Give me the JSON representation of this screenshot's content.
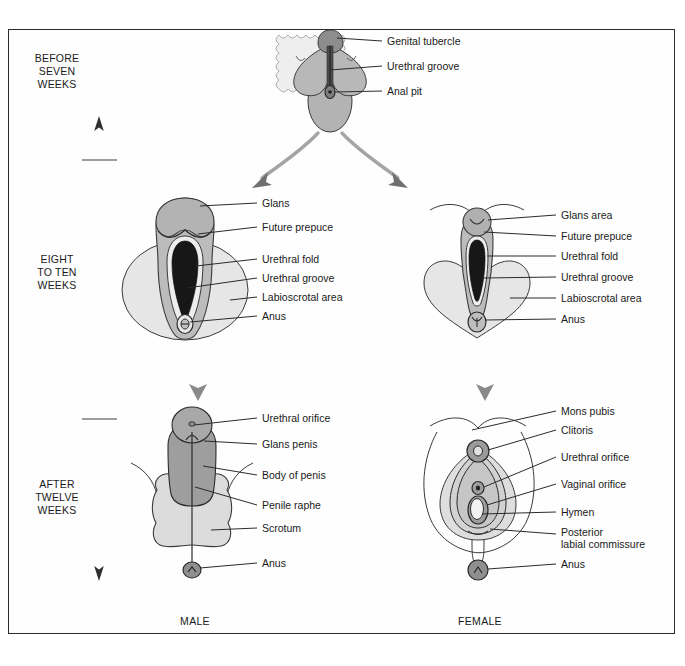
{
  "figure": {
    "type": "embryology-diagram",
    "background_color": "#ffffff",
    "border_color": "#2b2b2b",
    "fill_light": "#e3e3e3",
    "fill_mid": "#c9c9c9",
    "fill_dark": "#a9a9a9",
    "fill_darkest": "#8f8f8f",
    "line_color": "#2b2b2b",
    "arrow_color": "#8a8a8a"
  },
  "timeline": {
    "axis_name": "developmental-time-axis",
    "stages": [
      {
        "id": "before-seven-weeks",
        "label": "BEFORE\nSEVEN\nWEEKS"
      },
      {
        "id": "eight-to-ten-weeks",
        "label": "EIGHT\nTO TEN\nWEEKS"
      },
      {
        "id": "after-twelve-weeks",
        "label": "AFTER\nTWELVE\nWEEKS"
      }
    ]
  },
  "columns": [
    {
      "id": "male",
      "label": "MALE"
    },
    {
      "id": "female",
      "label": "FEMALE"
    }
  ],
  "panels": {
    "indifferent": {
      "id": "indifferent-stage-panel",
      "stage": "before-seven-weeks",
      "labels": [
        {
          "id": "genital-tubercle",
          "text": "Genital tubercle"
        },
        {
          "id": "urethral-groove",
          "text": "Urethral groove"
        },
        {
          "id": "anal-pit",
          "text": "Anal pit"
        }
      ]
    },
    "male_mid": {
      "id": "male-eight-to-ten-weeks-panel",
      "stage": "eight-to-ten-weeks",
      "sex": "male",
      "labels": [
        {
          "id": "glans",
          "text": "Glans"
        },
        {
          "id": "future-prepuce",
          "text": "Future prepuce"
        },
        {
          "id": "urethral-fold",
          "text": "Urethral fold"
        },
        {
          "id": "urethral-groove",
          "text": "Urethral groove"
        },
        {
          "id": "labioscrotal-area",
          "text": "Labioscrotal area"
        },
        {
          "id": "anus",
          "text": "Anus"
        }
      ]
    },
    "female_mid": {
      "id": "female-eight-to-ten-weeks-panel",
      "stage": "eight-to-ten-weeks",
      "sex": "female",
      "labels": [
        {
          "id": "glans-area",
          "text": "Glans area"
        },
        {
          "id": "future-prepuce",
          "text": "Future prepuce"
        },
        {
          "id": "urethral-fold",
          "text": "Urethral fold"
        },
        {
          "id": "urethral-groove",
          "text": "Urethral groove"
        },
        {
          "id": "labioscrotal-area",
          "text": "Labioscrotal area"
        },
        {
          "id": "anus",
          "text": "Anus"
        }
      ]
    },
    "male_late": {
      "id": "male-after-twelve-weeks-panel",
      "stage": "after-twelve-weeks",
      "sex": "male",
      "labels": [
        {
          "id": "urethral-orifice",
          "text": "Urethral orifice"
        },
        {
          "id": "glans-penis",
          "text": "Glans penis"
        },
        {
          "id": "body-of-penis",
          "text": "Body of penis"
        },
        {
          "id": "penile-raphe",
          "text": "Penile raphe"
        },
        {
          "id": "scrotum",
          "text": "Scrotum"
        },
        {
          "id": "anus",
          "text": "Anus"
        }
      ]
    },
    "female_late": {
      "id": "female-after-twelve-weeks-panel",
      "stage": "after-twelve-weeks",
      "sex": "female",
      "labels": [
        {
          "id": "mons-pubis",
          "text": "Mons pubis"
        },
        {
          "id": "clitoris",
          "text": "Clitoris"
        },
        {
          "id": "urethral-orifice",
          "text": "Urethral orifice"
        },
        {
          "id": "vaginal-orifice",
          "text": "Vaginal orifice"
        },
        {
          "id": "hymen",
          "text": "Hymen"
        },
        {
          "id": "posterior-labial-commissure",
          "text": "Posterior\nlabial commissure"
        },
        {
          "id": "anus",
          "text": "Anus"
        }
      ]
    }
  }
}
